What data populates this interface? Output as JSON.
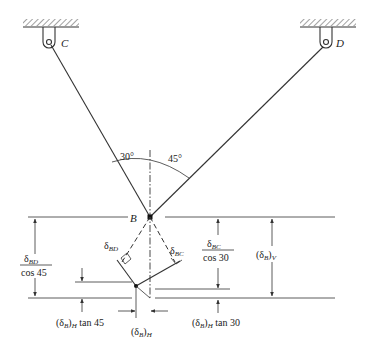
{
  "diagram": {
    "supports": [
      {
        "label": "C"
      },
      {
        "label": "D"
      }
    ],
    "joint_label": "B",
    "angles": {
      "left": "30°",
      "right": "45°"
    },
    "labels": {
      "delta_bd": {
        "base": "δ",
        "sub": "BD"
      },
      "delta_bc": {
        "base": "δ",
        "sub": "BC"
      },
      "frac_bd": {
        "num_base": "δ",
        "num_sub": "BD",
        "den": "cos 45"
      },
      "frac_bc": {
        "num_base": "δ",
        "num_sub": "BC",
        "den": "cos 30"
      },
      "delta_bv": {
        "open": "(δ",
        "sub1": "B",
        "close": ")",
        "sub2": "V"
      },
      "delta_bh": {
        "open": "(δ",
        "sub1": "B",
        "close": ")",
        "sub2": "H"
      },
      "delta_bh_tan45": {
        "open": "(δ",
        "sub1": "B",
        "close": ")",
        "sub2": "H",
        "tail": " tan 45"
      },
      "delta_bh_tan30": {
        "open": "(δ",
        "sub1": "B",
        "close": ")",
        "sub2": "H",
        "tail": " tan 30"
      }
    }
  }
}
